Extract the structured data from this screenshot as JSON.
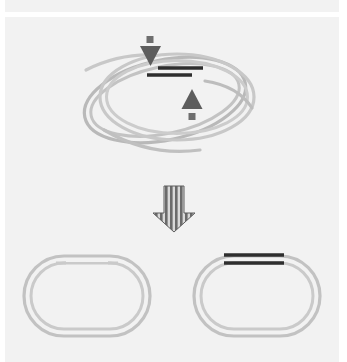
{
  "figure": {
    "width": 347,
    "height": 362,
    "background_color": "#ffffff",
    "panel_color": "#f2f2f2",
    "caption": ""
  },
  "palette": {
    "page_background": "#ffffff",
    "panel_background": "#f2f2f2",
    "top_band_background": "#f2f2f2",
    "strand_light": "#c6c6c6",
    "strand_mid": "#b4b4b4",
    "strand_dark_gray": "#a8a8a8",
    "segment_dark": "#2e2e2e",
    "arrow_dark": "#585858",
    "arrow_striped": "#6b6b6b",
    "arrow_stripe_light": "#d8d8d8"
  },
  "bands": {
    "top_band": {
      "label": "top-band",
      "x": 5,
      "y": 0,
      "width": 334,
      "height": 12
    },
    "main_panel": {
      "label": "main-panel",
      "x": 5,
      "y": 17,
      "width": 334,
      "height": 345
    }
  },
  "top_scene": {
    "name": "interlocked-catenane",
    "description": "Two interlocked double-stranded circular loops forming a catenane with a synapse region",
    "loops": [
      {
        "id": "loop-a",
        "label": "Loop A (upper, level)",
        "rotation_deg": 0,
        "center_x": 175,
        "center_y": 97,
        "rx": 78,
        "ry": 44,
        "stroke": "#c6c6c6",
        "stroke_width": 3.2
      },
      {
        "id": "loop-b",
        "label": "Loop B (tilted)",
        "rotation_deg": -12,
        "center_x": 165,
        "center_y": 100,
        "rx": 82,
        "ry": 40,
        "stroke": "#b4b4b4",
        "stroke_width": 3.2
      }
    ],
    "synapse": {
      "label": "synapse-region",
      "segments": [
        {
          "id": "dark-segment-top",
          "x1": 158,
          "y1": 68,
          "x2": 203,
          "y2": 68,
          "color": "#2e2e2e",
          "width": 3.4
        },
        {
          "id": "dark-segment-bottom",
          "x1": 147,
          "y1": 75,
          "x2": 192,
          "y2": 75,
          "color": "#2e2e2e",
          "width": 3.4
        }
      ]
    },
    "arrows": [
      {
        "id": "arrow-down-small",
        "label": "downward cut arrow",
        "direction": "down",
        "tip_x": 150,
        "tip_y": 66,
        "color": "#585858",
        "has_square_tail": true
      },
      {
        "id": "arrow-up-small",
        "label": "upward cut arrow",
        "direction": "up",
        "tip_x": 192,
        "tip_y": 89,
        "color": "#585858",
        "has_square_tail": true
      }
    ]
  },
  "transition_arrow": {
    "name": "striped-down-arrow",
    "label": "reaction transition arrow",
    "direction": "down",
    "x_center": 174,
    "y_top": 186,
    "y_bottom": 232,
    "shaft_width": 20,
    "head_width": 42,
    "stripe_count": 8,
    "stripe_color": "#6b6b6b",
    "stripe_gap_color": "#d9d9d9",
    "outline_color": "#5e5e5e"
  },
  "bottom_scene": {
    "name": "resolved-products",
    "description": "Two separate (unlinked) double-stranded circular products",
    "products": [
      {
        "id": "product-left",
        "label": "Left product circle (nicked / gapped at top)",
        "center_x": 87,
        "center_y": 296,
        "rx": 63,
        "ry": 40,
        "stroke": "#c0c0c0",
        "stroke_width": 3.2,
        "has_gap": true,
        "gap_label": "strand-gap",
        "dark_segments": []
      },
      {
        "id": "product-right",
        "label": "Right product circle (carries dark recombined segments)",
        "center_x": 257,
        "center_y": 296,
        "rx": 63,
        "ry": 40,
        "stroke": "#c0c0c0",
        "stroke_width": 3.2,
        "has_gap": false,
        "dark_segments": [
          {
            "id": "dark-bar-upper",
            "x1": 224,
            "y1": 255,
            "x2": 284,
            "y2": 255,
            "color": "#2e2e2e",
            "width": 3.4
          },
          {
            "id": "dark-bar-lower",
            "x1": 224,
            "y1": 263,
            "x2": 284,
            "y2": 263,
            "color": "#2e2e2e",
            "width": 3.4
          }
        ]
      }
    ]
  },
  "accessibility": {
    "figure_alt": "Schematic of a DNA catenane resolving into two separate circular products; arrows mark strand cleavage sites and a large striped arrow marks the reaction step."
  }
}
